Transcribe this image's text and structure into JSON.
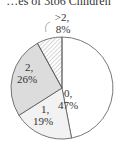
{
  "chart_data": {
    "type": "pie",
    "title": "…es of 3to6 Children",
    "slices": [
      {
        "label": "0",
        "value": 47,
        "text_label": "0,",
        "text_pct": "47%",
        "fill": "#ffffff"
      },
      {
        "label": "1",
        "value": 19,
        "text_label": "1,",
        "text_pct": "19%",
        "fill": "#f2f2f2"
      },
      {
        "label": "2",
        "value": 26,
        "text_label": "2,",
        "text_pct": "26%",
        "fill": "#dcdcdc"
      },
      {
        "label": ">2",
        "value": 8,
        "text_label": ">2,",
        "text_pct": "8%",
        "fill": "#ffffff"
      }
    ]
  }
}
